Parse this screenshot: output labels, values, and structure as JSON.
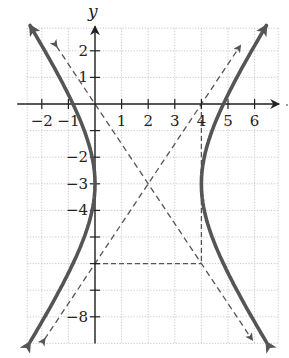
{
  "chart_data": {
    "type": "line",
    "title": "",
    "xlabel": "",
    "ylabel": "y",
    "xlim": [
      -3,
      7
    ],
    "ylim": [
      -9,
      3
    ],
    "grid": true,
    "x_ticks": [
      -2,
      -1,
      1,
      2,
      3,
      4,
      5,
      6
    ],
    "x_tick_labels": [
      "−2",
      "−1",
      "1",
      "2",
      "3",
      "4",
      "5",
      "6"
    ],
    "y_ticks": [
      2,
      1,
      -2,
      -3,
      -4,
      -8
    ],
    "y_tick_labels": [
      "2",
      "1",
      "−2",
      "−3",
      "−4",
      "−8"
    ],
    "center": [
      2,
      -3
    ],
    "vertices": [
      [
        0,
        -3
      ],
      [
        4,
        -3
      ]
    ],
    "a": 2,
    "b": 3,
    "asymptotes": [
      "y + 3 = 1.5(x - 2)",
      "y + 3 = -1.5(x - 2)"
    ],
    "dashed_box_segments": [
      [
        [
          0,
          -6
        ],
        [
          4,
          -6
        ]
      ],
      [
        [
          4,
          0
        ],
        [
          4,
          -6
        ]
      ]
    ],
    "series": [
      {
        "name": "hyperbola-left-branch",
        "style": "solid"
      },
      {
        "name": "hyperbola-right-branch",
        "style": "solid"
      },
      {
        "name": "asymptote-1",
        "style": "dashed"
      },
      {
        "name": "asymptote-2",
        "style": "dashed"
      }
    ]
  },
  "axis": {
    "y_label": "y"
  },
  "colors": {
    "curve": "#555555",
    "axis": "#222222",
    "grid": "#bbbbbb",
    "dashed": "#555555"
  }
}
